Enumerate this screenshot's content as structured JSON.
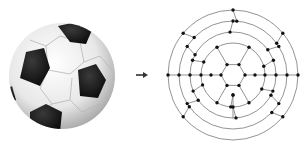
{
  "figure": {
    "left_panel": {
      "label": "soccer-ball",
      "center": [
        62,
        76
      ],
      "radius": 53
    },
    "arrow": {
      "label": "maps-to",
      "x1": 136,
      "x2": 147,
      "y": 75
    },
    "right_panel": {
      "label": "soccer-ball-graph",
      "center": [
        233,
        75
      ],
      "ring_radii": [
        65,
        54,
        43,
        32
      ],
      "hexagon_radius": 12,
      "node_color": "#111111",
      "edge_color": "#777777"
    }
  }
}
